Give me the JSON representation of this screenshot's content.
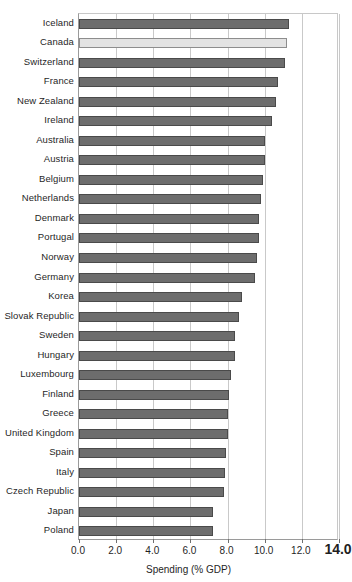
{
  "chart_data": {
    "type": "bar",
    "orientation": "horizontal",
    "title": "",
    "xlabel": "Spending (% GDP)",
    "ylabel": "",
    "xlim": [
      0.0,
      14.0
    ],
    "xticks": [
      "0.0",
      "2.0",
      "4.0",
      "6.0",
      "8.0",
      "10.0",
      "12.0",
      "14.0"
    ],
    "xtick_values": [
      0.0,
      2.0,
      4.0,
      6.0,
      8.0,
      10.0,
      12.0,
      14.0
    ],
    "grid": "vertical",
    "legend": "none",
    "highlight_category": "Canada",
    "colors": {
      "bar": "#6d6d6d",
      "bar_edge": "#4a4a4a",
      "highlight_bar": "#e3e3e3",
      "highlight_bar_edge": "#8d8d8d",
      "gridline": "#c9c9c9",
      "axis": "#9a9a9a",
      "text": "#1f1f1f",
      "background": "#ffffff"
    },
    "categories": [
      "Iceland",
      "Canada",
      "Switzerland",
      "France",
      "New Zealand",
      "Ireland",
      "Australia",
      "Austria",
      "Belgium",
      "Netherlands",
      "Denmark",
      "Portugal",
      "Norway",
      "Germany",
      "Korea",
      "Slovak Republic",
      "Sweden",
      "Hungary",
      "Luxembourg",
      "Finland",
      "Greece",
      "United Kingdom",
      "Spain",
      "Italy",
      "Czech Republic",
      "Japan",
      "Poland"
    ],
    "values": [
      11.3,
      11.2,
      11.1,
      10.7,
      10.6,
      10.4,
      10.0,
      10.0,
      9.9,
      9.8,
      9.7,
      9.7,
      9.6,
      9.5,
      8.8,
      8.6,
      8.4,
      8.4,
      8.2,
      8.1,
      8.0,
      8.0,
      7.9,
      7.85,
      7.8,
      7.2,
      7.2
    ],
    "values_suffix": "%",
    "series": [
      {
        "name": "Spending (% GDP)",
        "values": [
          11.3,
          11.2,
          11.1,
          10.7,
          10.6,
          10.4,
          10.0,
          10.0,
          9.9,
          9.8,
          9.7,
          9.7,
          9.6,
          9.5,
          8.8,
          8.6,
          8.4,
          8.4,
          8.2,
          8.1,
          8.0,
          8.0,
          7.9,
          7.85,
          7.8,
          7.2,
          7.2
        ]
      }
    ]
  }
}
